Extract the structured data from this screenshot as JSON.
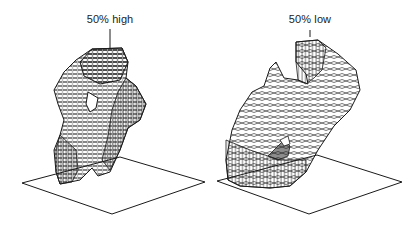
{
  "figure": {
    "panels": [
      {
        "id": "left",
        "label": "50% high",
        "description": "3D wireframe isosurface rendered above a flat base plane (50% high contour)"
      },
      {
        "id": "right",
        "label": "50% low",
        "description": "3D wireframe isosurface rendered above a flat base plane (50% low contour)"
      }
    ],
    "colors": {
      "line": "#1a1a1a",
      "background": "#ffffff"
    }
  }
}
